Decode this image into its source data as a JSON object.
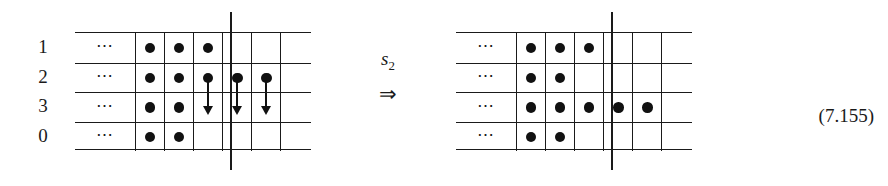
{
  "figure": {
    "equation_number": "(7.155)",
    "operator": {
      "symbol": "s",
      "subscript": "2",
      "implies": "⇒"
    },
    "ellipsis": "⋯",
    "row_labels": [
      "1",
      "2",
      "3",
      "0"
    ],
    "colors": {
      "ink": "#1a1a1a",
      "dot": "#111111",
      "background": "#ffffff"
    },
    "left_grid": {
      "name": "before-state",
      "columns": 6,
      "separator_after_column": 3,
      "rows": [
        {
          "label": "1",
          "dots": [
            1,
            1,
            1,
            0,
            0,
            0
          ],
          "arrows": [
            0,
            0,
            0,
            0,
            0,
            0
          ]
        },
        {
          "label": "2",
          "dots": [
            1,
            1,
            1,
            1,
            1,
            0
          ],
          "arrows": [
            0,
            0,
            1,
            1,
            1,
            0
          ]
        },
        {
          "label": "3",
          "dots": [
            1,
            1,
            0,
            0,
            0,
            0
          ],
          "arrows": [
            0,
            0,
            0,
            0,
            0,
            0
          ]
        },
        {
          "label": "0",
          "dots": [
            1,
            1,
            0,
            0,
            0,
            0
          ],
          "arrows": [
            0,
            0,
            0,
            0,
            0,
            0
          ]
        }
      ]
    },
    "right_grid": {
      "name": "after-state",
      "columns": 6,
      "separator_after_column": 3,
      "rows": [
        {
          "label": "1",
          "dots": [
            1,
            1,
            1,
            0,
            0,
            0
          ],
          "arrows": [
            0,
            0,
            0,
            0,
            0,
            0
          ]
        },
        {
          "label": "2",
          "dots": [
            1,
            1,
            0,
            0,
            0,
            0
          ],
          "arrows": [
            0,
            0,
            0,
            0,
            0,
            0
          ]
        },
        {
          "label": "3",
          "dots": [
            1,
            1,
            1,
            1,
            1,
            0
          ],
          "arrows": [
            0,
            0,
            0,
            0,
            0,
            0
          ]
        },
        {
          "label": "0",
          "dots": [
            1,
            1,
            0,
            0,
            0,
            0
          ],
          "arrows": [
            0,
            0,
            0,
            0,
            0,
            0
          ]
        }
      ]
    }
  }
}
